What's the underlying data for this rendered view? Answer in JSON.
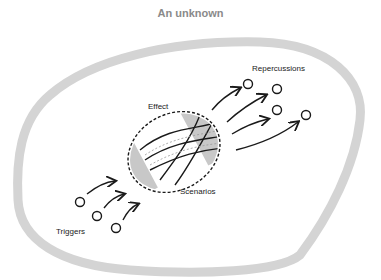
{
  "title": "An unknown",
  "labels": {
    "effect": "Effect",
    "scenarios": "Scenarios",
    "repercussions": "Repercussions",
    "triggers": "Triggers"
  },
  "colors": {
    "outline": "#d4d4d4",
    "ink": "#1a1a1a",
    "title": "#8a8a8a",
    "band": "#c8c8c8"
  }
}
